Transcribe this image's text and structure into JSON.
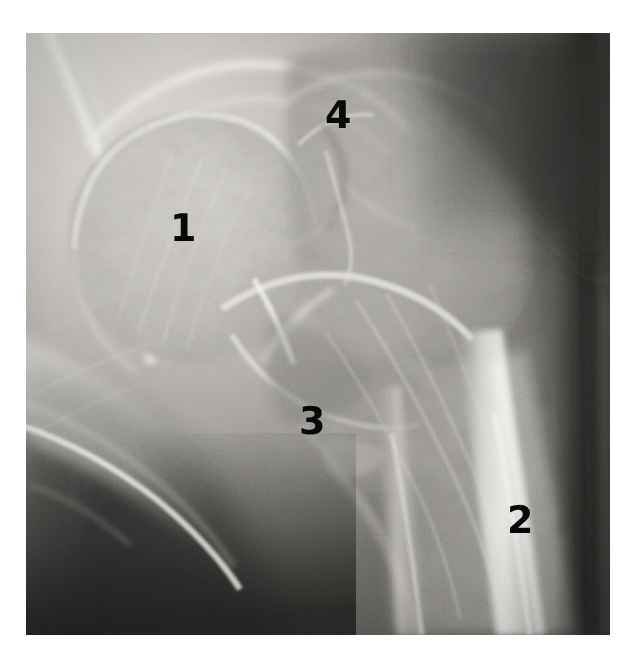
{
  "figure": {
    "kind": "radiograph",
    "modality": "X-ray",
    "view": "anteroposterior-hip",
    "canvas": {
      "width": 637,
      "height": 658
    },
    "plate": {
      "x": 26,
      "y": 33,
      "width": 584,
      "height": 602
    },
    "background_color": "#ffffff",
    "label_color": "#080808"
  },
  "labels": [
    {
      "text": "1",
      "x": 170,
      "y": 209,
      "size": 38,
      "region": "femoral-head"
    },
    {
      "text": "2",
      "x": 507,
      "y": 501,
      "size": 38,
      "region": "femoral-shaft-cortex"
    },
    {
      "text": "3",
      "x": 299,
      "y": 402,
      "size": 38,
      "region": "femoral-neck-calcar"
    },
    {
      "text": "4",
      "x": 325,
      "y": 96,
      "size": 38,
      "region": "greater-trochanter"
    }
  ],
  "tones": {
    "plate_base": "#5a5a5a",
    "brightest_bone": "#f2f0ec",
    "bright_bone": "#d8d5cf",
    "mid_bone": "#a8a6a2",
    "soft_tissue": "#6e6c69",
    "dark_tissue": "#3a3937",
    "darkest": "#1d1d1c"
  }
}
